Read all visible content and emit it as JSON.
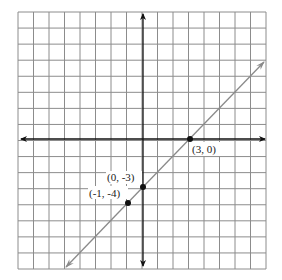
{
  "graph": {
    "type": "coordinate-plane-line",
    "grid": {
      "columns": 16,
      "rows": 16,
      "x_range": [
        -8,
        8
      ],
      "y_range": [
        -8,
        8
      ]
    },
    "line": {
      "equation": "y = x - 3",
      "slope": 1,
      "y_intercept": -3,
      "color": "#8a8a8a"
    },
    "points": [
      {
        "x": 3,
        "y": 0,
        "label": "(3, 0)"
      },
      {
        "x": 0,
        "y": -3,
        "label": "(0, -3)"
      },
      {
        "x": -1,
        "y": -4,
        "label": "(-1, -4)"
      }
    ],
    "colors": {
      "grid": "#8c8c8c",
      "axes": "#111111",
      "points": "#111111"
    }
  }
}
